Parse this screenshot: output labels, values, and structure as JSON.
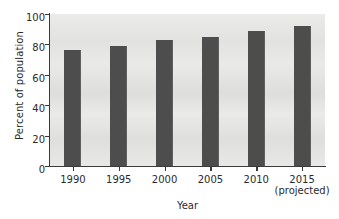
{
  "chart_data": {
    "type": "bar",
    "title": "",
    "xlabel": "Year",
    "ylabel": "Percent of population",
    "categories": [
      "1990",
      "1995",
      "2000",
      "2005",
      "2010",
      "2015"
    ],
    "category_sublabels": [
      "",
      "",
      "",
      "",
      "",
      "(projected)"
    ],
    "values": [
      76,
      79,
      83,
      85,
      89,
      92
    ],
    "ylim": [
      0,
      100
    ],
    "yticks": [
      0,
      20,
      40,
      60,
      80,
      100
    ],
    "ytick_labels": [
      "0",
      "20",
      "40",
      "60",
      "80",
      "100"
    ],
    "grid": false,
    "legend": "none",
    "bar_color": "#4d4d4d",
    "plot_background": "#e2e2e0",
    "axis_color": "#3a3a3a"
  }
}
